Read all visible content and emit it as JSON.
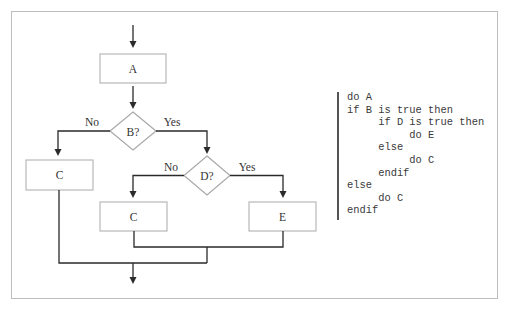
{
  "flowchart": {
    "nodes": {
      "a": {
        "label": "A",
        "type": "process"
      },
      "b": {
        "label": "B?",
        "type": "decision"
      },
      "c_left": {
        "label": "C",
        "type": "process"
      },
      "d": {
        "label": "D?",
        "type": "decision"
      },
      "c_mid": {
        "label": "C",
        "type": "process"
      },
      "e": {
        "label": "E",
        "type": "process"
      }
    },
    "edge_labels": {
      "b_no": "No",
      "b_yes": "Yes",
      "d_no": "No",
      "d_yes": "Yes"
    }
  },
  "pseudocode": {
    "lines": [
      "do A",
      "if B is true then",
      "     if D is true then",
      "          do E",
      "     else",
      "          do C",
      "     endif",
      "else",
      "     do C",
      "endif"
    ]
  },
  "colors": {
    "frame_border": "#bdbdbd",
    "box_border": "#b8b8b8",
    "line": "#2a2a2a",
    "code_text": "#3a3a3a",
    "code_bar": "#555555"
  }
}
